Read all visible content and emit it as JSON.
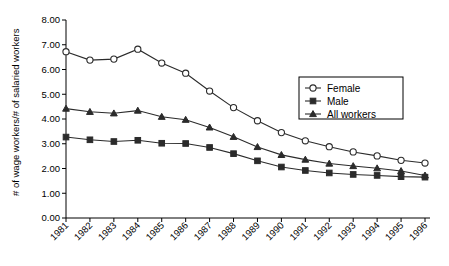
{
  "chart_data": {
    "type": "line",
    "title": "",
    "xlabel": "",
    "ylabel": "# of wage workers/# of salaried workers",
    "ylim": [
      0.0,
      8.0
    ],
    "ytick_step": 1.0,
    "ytick_labels": [
      "0.00",
      "1.00",
      "2.00",
      "3.00",
      "4.00",
      "5.00",
      "6.00",
      "7.00",
      "8.00"
    ],
    "grid": false,
    "legend_position": "upper-right",
    "categories": [
      "1981",
      "1982",
      "1983",
      "1984",
      "1985",
      "1986",
      "1987",
      "1988",
      "1989",
      "1990",
      "1991",
      "1992",
      "1993",
      "1994",
      "1995",
      "1996"
    ],
    "series": [
      {
        "name": "Female",
        "marker": "open-circle",
        "values": [
          6.72,
          6.38,
          6.42,
          6.82,
          6.26,
          5.85,
          5.13,
          4.46,
          3.93,
          3.45,
          3.12,
          2.88,
          2.67,
          2.51,
          2.33,
          2.22
        ]
      },
      {
        "name": "Male",
        "marker": "filled-square",
        "values": [
          3.27,
          3.16,
          3.09,
          3.14,
          3.02,
          3.01,
          2.85,
          2.6,
          2.31,
          2.06,
          1.92,
          1.82,
          1.76,
          1.72,
          1.67,
          1.65
        ]
      },
      {
        "name": "All workers",
        "marker": "filled-triangle",
        "values": [
          4.42,
          4.29,
          4.23,
          4.34,
          4.09,
          3.97,
          3.66,
          3.28,
          2.87,
          2.55,
          2.36,
          2.2,
          2.1,
          2.01,
          1.9,
          1.72
        ]
      }
    ]
  },
  "legend": {
    "entries": [
      {
        "label": "Female"
      },
      {
        "label": "Male"
      },
      {
        "label": "All workers"
      }
    ]
  },
  "axes": {
    "y_axis_title": "# of wage workers/# of salaried workers"
  }
}
